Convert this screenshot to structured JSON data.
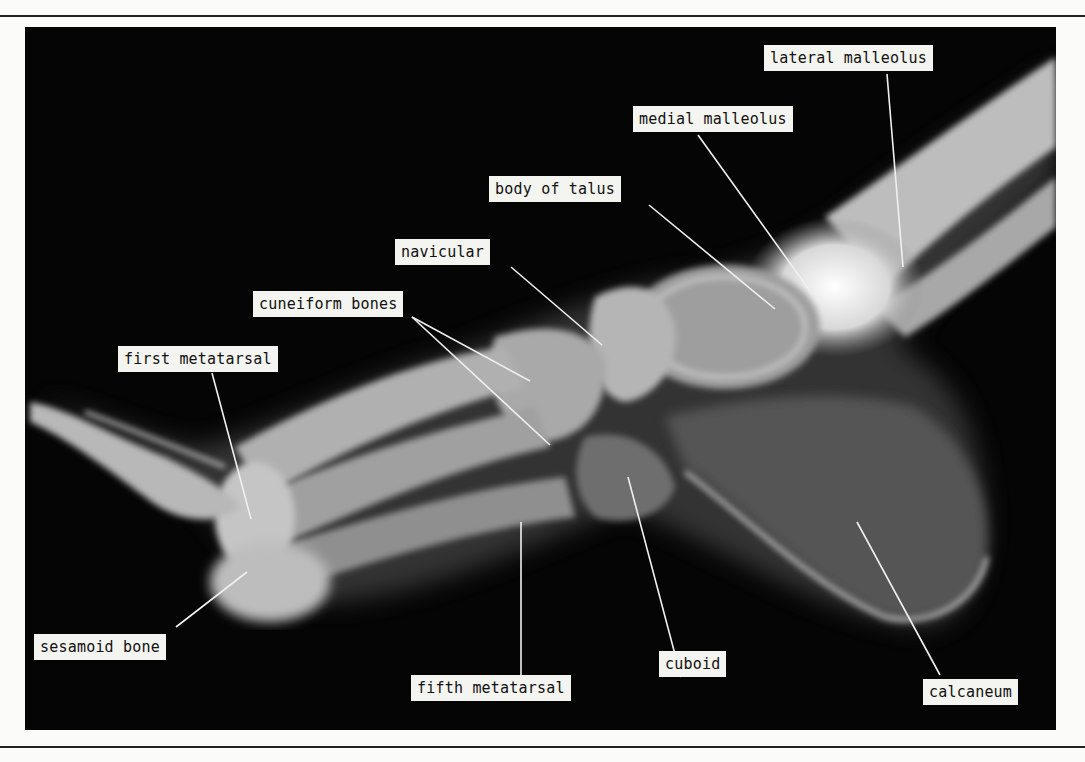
{
  "figure": {
    "type": "annotated lateral radiograph of foot and ankle",
    "labels": [
      {
        "id": "lateral-malleolus",
        "text": "lateral malleolus"
      },
      {
        "id": "medial-malleolus",
        "text": "medial malleolus"
      },
      {
        "id": "body-of-talus",
        "text": "body of talus"
      },
      {
        "id": "navicular",
        "text": "navicular"
      },
      {
        "id": "cuneiform-bones",
        "text": "cuneiform bones"
      },
      {
        "id": "first-metatarsal",
        "text": "first metatarsal"
      },
      {
        "id": "sesamoid-bone",
        "text": "sesamoid bone"
      },
      {
        "id": "fifth-metatarsal",
        "text": "fifth metatarsal"
      },
      {
        "id": "cuboid",
        "text": "cuboid"
      },
      {
        "id": "calcaneum",
        "text": "calcaneum"
      }
    ],
    "colors": {
      "background": "#050505",
      "label_fill": "#f4f4f0",
      "label_text": "#111111",
      "leader_line": "#f0f0f0"
    }
  }
}
